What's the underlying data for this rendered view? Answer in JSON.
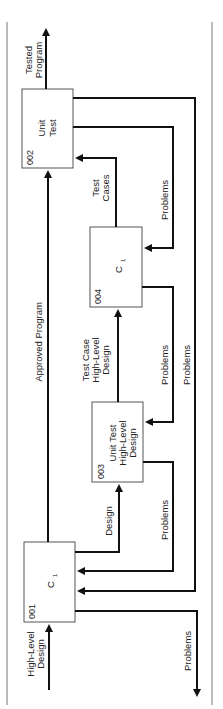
{
  "diagram": {
    "orientation": "rotated-90-ccw",
    "colors": {
      "line": "#111111",
      "frame": "#666666",
      "box_border": "#555555",
      "background": "#ffffff"
    },
    "boxes": [
      {
        "id": "002",
        "label_lines": [
          "Unit",
          "Test"
        ]
      },
      {
        "id": "004",
        "label": "C",
        "subscript": "1"
      },
      {
        "id": "003",
        "label_lines": [
          "Unit Test",
          "High-Level",
          "Design"
        ]
      },
      {
        "id": "001",
        "label": "C",
        "subscript": "1"
      }
    ],
    "arrows": {
      "tested_program": [
        "Tested",
        "Program"
      ],
      "test_cases": [
        "Test",
        "Cases"
      ],
      "approved_program": "Approved Program",
      "test_case_hld": [
        "Test Case",
        "High-Level",
        "Design"
      ],
      "design": "Design",
      "high_level_design": [
        "High-Level",
        "Design"
      ],
      "problems_002_to_004": "Problems",
      "problems_004_to_003": "Problems",
      "problems_004_to_001": "Problems",
      "problems_003_to_001": "Problems",
      "problems_out": "Problems"
    }
  }
}
